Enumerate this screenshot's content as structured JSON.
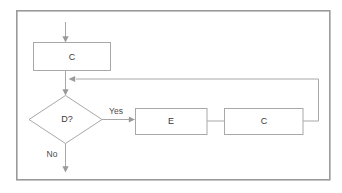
{
  "diagram": {
    "type": "flowchart",
    "frame": {
      "name": "outer-frame",
      "x": 16,
      "y": 10,
      "width": 314,
      "height": 170,
      "border_color": "#9a9a9a",
      "background_color": "#ffffff"
    },
    "palette": {
      "shape_stroke": "#a8a8a8",
      "shape_fill": "#ffffff",
      "connector": "#a8a8a8",
      "text": "#3a3a3a",
      "label_text": "#4a4a4a"
    },
    "nodes": [
      {
        "id": "proc-c-top",
        "shape": "rectangle",
        "label": "C",
        "x": 33,
        "y": 42,
        "width": 77,
        "height": 28
      },
      {
        "id": "decision-d",
        "shape": "diamond",
        "label": "D?",
        "cx": 65,
        "cy": 119,
        "rx": 37,
        "ry": 24
      },
      {
        "id": "proc-e",
        "shape": "rectangle",
        "label": "E",
        "x": 135,
        "y": 108,
        "width": 72,
        "height": 26
      },
      {
        "id": "proc-c-right",
        "shape": "rectangle",
        "label": "C",
        "x": 224,
        "y": 108,
        "width": 79,
        "height": 26
      }
    ],
    "edges": [
      {
        "id": "entry-arrow",
        "from": "start",
        "to": "proc-c-top",
        "label": "",
        "arrow": true
      },
      {
        "id": "c-top-to-decision",
        "from": "proc-c-top",
        "to": "decision-d",
        "label": "",
        "arrow": true
      },
      {
        "id": "decision-yes-to-e",
        "from": "decision-d",
        "to": "proc-e",
        "label": "Yes",
        "arrow": true
      },
      {
        "id": "e-to-c-right",
        "from": "proc-e",
        "to": "proc-c-right",
        "label": "",
        "arrow": false
      },
      {
        "id": "feedback-loop",
        "from": "proc-c-right",
        "to": "c-top-to-decision",
        "label": "",
        "arrow": true
      },
      {
        "id": "decision-no-exit",
        "from": "decision-d",
        "to": "end",
        "label": "No",
        "arrow": true
      }
    ],
    "labels": {
      "yes": "Yes",
      "no": "No",
      "node_c_top": "C",
      "node_d": "D?",
      "node_e": "E",
      "node_c_right": "C"
    }
  }
}
